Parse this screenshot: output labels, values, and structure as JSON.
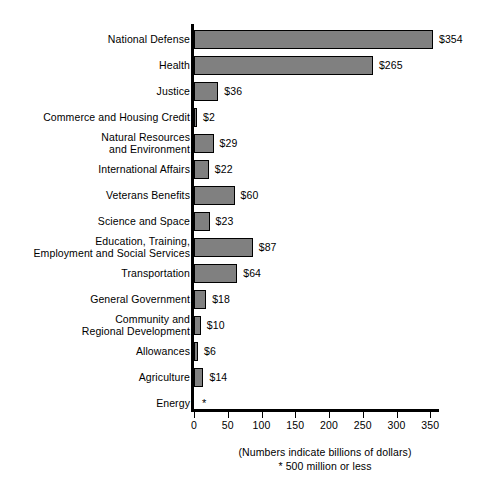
{
  "chart_data": {
    "type": "bar",
    "orientation": "horizontal",
    "title": "",
    "subtitle": "",
    "xlabel": "",
    "ylabel": "",
    "xlim": [
      0,
      368
    ],
    "xticks": [
      0,
      50,
      100,
      150,
      200,
      250,
      300,
      350
    ],
    "xtick_labels": [
      "0",
      "50",
      "100",
      "150",
      "200",
      "250",
      "300",
      "350"
    ],
    "grid": false,
    "legend": null,
    "bar_color": "#808080",
    "bar_edge_color": "#000000",
    "categories": [
      "National Defense",
      "Health",
      "Justice",
      "Commerce and Housing Credit",
      "Natural Resources and Environment",
      "International Affairs",
      "Veterans Benefits",
      "Science and Space",
      "Education, Training, Employment and Social Services",
      "Transportation",
      "General Government",
      "Community and Regional Development",
      "Allowances",
      "Agriculture",
      "Energy"
    ],
    "values": [
      354,
      265,
      36,
      2,
      29,
      22,
      60,
      23,
      87,
      64,
      18,
      10,
      6,
      14,
      0
    ],
    "value_labels": [
      "$354",
      "$265",
      "$36",
      "$2",
      "$29",
      "$22",
      "$60",
      "$23",
      "$87",
      "$64",
      "$18",
      "$10",
      "$6",
      "$14",
      "*"
    ],
    "annotations": [
      "(Numbers indicate billions of dollars)",
      "* 500 million or less"
    ]
  },
  "rows": [
    {
      "label_lines": [
        "National Defense"
      ],
      "value": 354,
      "value_label": "$354"
    },
    {
      "label_lines": [
        "Health"
      ],
      "value": 265,
      "value_label": "$265"
    },
    {
      "label_lines": [
        "Justice"
      ],
      "value": 36,
      "value_label": "$36"
    },
    {
      "label_lines": [
        "Commerce and Housing Credit"
      ],
      "value": 2,
      "value_label": "$2"
    },
    {
      "label_lines": [
        "Natural Resources",
        "and Environment"
      ],
      "value": 29,
      "value_label": "$29"
    },
    {
      "label_lines": [
        "International Affairs"
      ],
      "value": 22,
      "value_label": "$22"
    },
    {
      "label_lines": [
        "Veterans Benefits"
      ],
      "value": 60,
      "value_label": "$60"
    },
    {
      "label_lines": [
        "Science and Space"
      ],
      "value": 23,
      "value_label": "$23"
    },
    {
      "label_lines": [
        "Education, Training,",
        "Employment and Social Services"
      ],
      "value": 87,
      "value_label": "$87"
    },
    {
      "label_lines": [
        "Transportation"
      ],
      "value": 64,
      "value_label": "$64"
    },
    {
      "label_lines": [
        "General Government"
      ],
      "value": 18,
      "value_label": "$18"
    },
    {
      "label_lines": [
        "Community and",
        "Regional Development"
      ],
      "value": 10,
      "value_label": "$10"
    },
    {
      "label_lines": [
        "Allowances"
      ],
      "value": 6,
      "value_label": "$6"
    },
    {
      "label_lines": [
        "Agriculture"
      ],
      "value": 14,
      "value_label": "$14"
    },
    {
      "label_lines": [
        "Energy"
      ],
      "value": 0,
      "value_label": "*"
    }
  ],
  "axis": {
    "ticks": [
      {
        "value": 0,
        "label": "0"
      },
      {
        "value": 50,
        "label": "50"
      },
      {
        "value": 100,
        "label": "100"
      },
      {
        "value": 150,
        "label": "150"
      },
      {
        "value": 200,
        "label": "200"
      },
      {
        "value": 250,
        "label": "250"
      },
      {
        "value": 300,
        "label": "300"
      },
      {
        "value": 350,
        "label": "350"
      }
    ]
  },
  "footnotes": {
    "units": "(Numbers indicate billions of dollars)",
    "asterisk": "* 500 million or less"
  },
  "colors": {
    "bar_fill": "#808080",
    "bar_stroke": "#000000",
    "axis": "#000000",
    "text": "#000000",
    "background": "#ffffff"
  }
}
